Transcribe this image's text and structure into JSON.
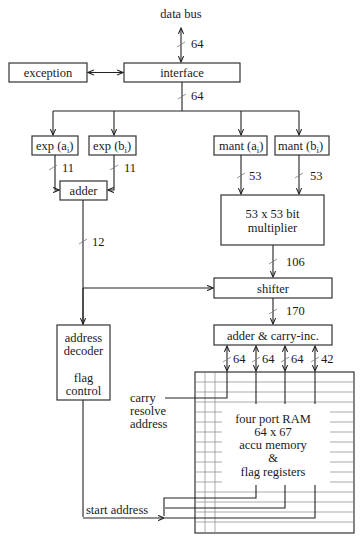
{
  "diagram": {
    "type": "block-diagram",
    "nodes": {
      "data_bus": "data bus",
      "interface": "interface",
      "exception": "exception",
      "exp_a": "exp (a",
      "exp_b": "exp (b",
      "mant_a": "mant (a",
      "mant_b": "mant (b",
      "subscript_i": "i",
      "adder": "adder",
      "multiplier_line1": "53 x 53 bit",
      "multiplier_line2": "multiplier",
      "shifter": "shifter",
      "adder_carry": "adder & carry-inc.",
      "addr_dec_line1": "address",
      "addr_dec_line2": "decoder",
      "addr_dec_line3": "flag",
      "addr_dec_line4": "control",
      "carry_line1": "carry",
      "carry_line2": "resolve",
      "carry_line3": "address",
      "ram_line1": "four port RAM",
      "ram_line2": "64 x 67",
      "ram_line3": "accu memory",
      "ram_line4": "&",
      "ram_line5": "flag registers",
      "start_address": "start address"
    },
    "bus_widths": {
      "data_bus": "64",
      "interface_out": "64",
      "exp_a_out": "11",
      "exp_b_out": "11",
      "mant_a_out": "53",
      "mant_b_out": "53",
      "adder_out": "12",
      "multiplier_out": "106",
      "shifter_out": "170",
      "ram_port1": "64",
      "ram_port2": "64",
      "ram_port3": "64",
      "ram_port4": "42"
    },
    "edges": [
      {
        "from": "data_bus",
        "to": "interface",
        "width": "64",
        "bidirectional": true
      },
      {
        "from": "exception",
        "to": "interface",
        "bidirectional": true
      },
      {
        "from": "interface",
        "to": [
          "exp_a",
          "exp_b",
          "mant_a",
          "mant_b"
        ],
        "width": "64"
      },
      {
        "from": "exp_a",
        "to": "adder",
        "width": "11"
      },
      {
        "from": "exp_b",
        "to": "adder",
        "width": "11"
      },
      {
        "from": "mant_a",
        "to": "multiplier",
        "width": "53"
      },
      {
        "from": "mant_b",
        "to": "multiplier",
        "width": "53"
      },
      {
        "from": "adder",
        "to": [
          "shifter",
          "address_decoder"
        ],
        "width": "12"
      },
      {
        "from": "multiplier",
        "to": "shifter",
        "width": "106"
      },
      {
        "from": "shifter",
        "to": "adder_carry",
        "width": "170"
      },
      {
        "from": "adder_carry",
        "to": "ram",
        "widths": [
          "64",
          "64",
          "64",
          "42"
        ],
        "bidirectional": true
      },
      {
        "from": "ram",
        "to": "start_address",
        "label": "start address"
      },
      {
        "from": "ram",
        "to": "carry_resolve_address"
      }
    ]
  }
}
